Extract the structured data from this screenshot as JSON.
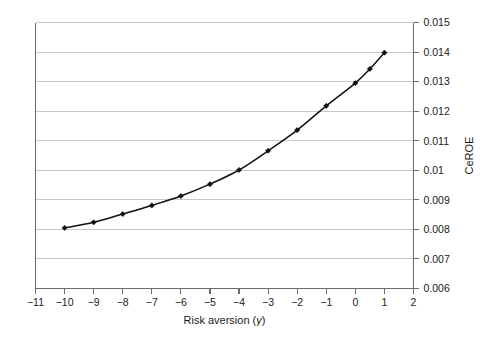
{
  "chart_data": {
    "type": "line",
    "title": "",
    "subtitle": "",
    "xlabel": "Risk aversion (γ)",
    "xlabel_text": "Risk aversion (",
    "xlabel_symbol": "γ",
    "xlabel_close": ")",
    "ylabel": "CeROE",
    "xlim": [
      -11,
      2
    ],
    "ylim": [
      0.006,
      0.015
    ],
    "grid": true,
    "grid_axis": "y",
    "legend": "none",
    "y_axis_position": "right",
    "xticks": [
      -11,
      -10,
      -9,
      -8,
      -7,
      -6,
      -5,
      -4,
      -3,
      -2,
      -1,
      0,
      1,
      2
    ],
    "xtick_labels": [
      "−11",
      "−10",
      "−9",
      "−8",
      "−7",
      "−6",
      "−5",
      "−4",
      "−3",
      "−2",
      "−1",
      "0",
      "1",
      "2"
    ],
    "yticks": [
      0.006,
      0.007,
      0.008,
      0.009,
      0.01,
      0.011,
      0.012,
      0.013,
      0.014,
      0.015
    ],
    "ytick_labels": [
      "0.006",
      "0.007",
      "0.008",
      "0.009",
      "0.01",
      "0.011",
      "0.012",
      "0.013",
      "0.014",
      "0.015"
    ],
    "series": [
      {
        "name": "CeROE",
        "marker": "diamond",
        "color": "#111111",
        "x": [
          -10,
          -9,
          -8,
          -7,
          -6,
          -5,
          -4,
          -3,
          -2,
          -1,
          0,
          0.5,
          1
        ],
        "values": [
          0.00805,
          0.00824,
          0.00852,
          0.00881,
          0.00913,
          0.00953,
          0.01001,
          0.01066,
          0.01136,
          0.01218,
          0.01295,
          0.01343,
          0.01398
        ]
      }
    ]
  },
  "axes": {
    "x_axis_name": "risk-aversion-axis",
    "y_axis_name": "ceroe-axis"
  }
}
